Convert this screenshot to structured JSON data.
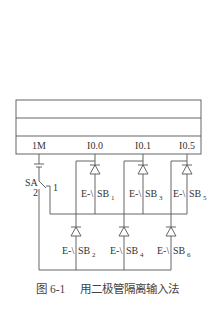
{
  "figure": {
    "caption_number": "图 6-1",
    "caption_text": "用二极管隔离输入法"
  },
  "plc": {
    "terminals": [
      {
        "label": "1M"
      },
      {
        "label": "I0.0"
      },
      {
        "label": "I0.1"
      },
      {
        "label": "I0.5"
      }
    ]
  },
  "selector_switch": {
    "label": "SA",
    "position_1": "1",
    "position_2": "2"
  },
  "buttons": [
    {
      "prefix": "E-\\",
      "name": "SB",
      "index": "1"
    },
    {
      "prefix": "E-\\",
      "name": "SB",
      "index": "2"
    },
    {
      "prefix": "E-\\",
      "name": "SB",
      "index": "3"
    },
    {
      "prefix": "E-\\",
      "name": "SB",
      "index": "4"
    },
    {
      "prefix": "E-\\",
      "name": "SB",
      "index": "5"
    },
    {
      "prefix": "E-\\",
      "name": "SB",
      "index": "6"
    }
  ],
  "colors": {
    "line": "#555555",
    "text": "#333333"
  }
}
